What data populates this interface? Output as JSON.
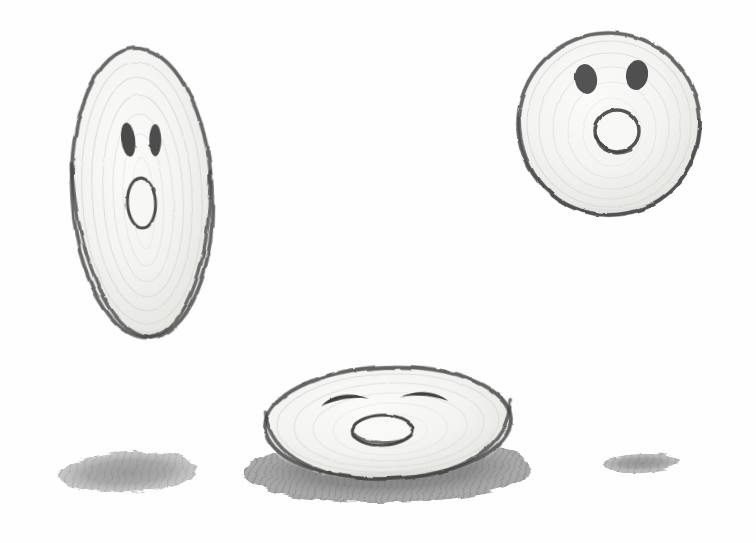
{
  "artwork": {
    "title": "Three Onion Characters",
    "medium": "graphite pencil on white paper",
    "canvas": {
      "width": 756,
      "height": 543,
      "background_color": "#fefefe"
    },
    "palette": {
      "paper": "#fefefe",
      "outline_light": "#9a9a9a",
      "outline_dark": "#5c5c5c",
      "outline_darkest": "#3e3e3e",
      "interior_fill": "#f4f4f2",
      "interior_shade": "#e3e3e1",
      "ring_texture": "#d8d8d6",
      "feature_fill": "#4a4a4a",
      "shadow_dark": "#6e6e6e",
      "shadow_mid": "#8c8c8c",
      "shadow_light": "#b4b4b4"
    }
  },
  "figures": [
    {
      "id": "figure-tall-left",
      "label": "Tall vertical onion character",
      "shape": "vertical ellipse",
      "center": {
        "x": 142,
        "y": 193
      },
      "radius": {
        "x": 70,
        "y": 145
      },
      "rotation_deg": -3,
      "expression": "surprised",
      "eyes": {
        "style": "filled vertical capsules",
        "left": {
          "cx": 131,
          "cy": 139,
          "rx": 7,
          "ry": 17
        },
        "right": {
          "cx": 158,
          "cy": 141,
          "rx": 6,
          "ry": 16
        }
      },
      "mouth": {
        "style": "open vertical oval outline",
        "cx": 141,
        "cy": 203,
        "rx": 14,
        "ry": 25,
        "filled": false
      },
      "stray_stroke": true
    },
    {
      "id": "figure-round-right",
      "label": "Round onion character, upper right",
      "shape": "circle",
      "center": {
        "x": 609,
        "y": 124
      },
      "radius": {
        "x": 91,
        "y": 91
      },
      "rotation_deg": 0,
      "expression": "surprised",
      "eyes": {
        "style": "filled tilted ovals",
        "left": {
          "cx": 586,
          "cy": 79,
          "rx": 11,
          "ry": 15
        },
        "right": {
          "cx": 637,
          "cy": 75,
          "rx": 11,
          "ry": 15
        }
      },
      "mouth": {
        "style": "open circular ring outline",
        "cx": 617,
        "cy": 131,
        "rx": 22,
        "ry": 21,
        "filled": false
      },
      "stray_stroke": false
    },
    {
      "id": "figure-squashed-bottom",
      "label": "Squashed wide onion character, bottom center",
      "shape": "wide flattened ellipse",
      "center": {
        "x": 388,
        "y": 423
      },
      "radius": {
        "x": 123,
        "y": 56
      },
      "rotation_deg": -2,
      "expression": "happy",
      "eyes": {
        "style": "arched curved lines",
        "left": {
          "cx": 346,
          "cy": 402,
          "rx": 24,
          "ry": 11
        },
        "right": {
          "cx": 425,
          "cy": 399,
          "rx": 24,
          "ry": 11
        }
      },
      "mouth": {
        "style": "wide flat oval outline",
        "cx": 382,
        "cy": 430,
        "rx": 30,
        "ry": 15,
        "filled": false
      },
      "stray_stroke": false
    }
  ],
  "shadows": [
    {
      "id": "shadow-left",
      "label": "Cast shadow ellipse, lower left",
      "cx": 128,
      "cy": 472,
      "rx": 70,
      "ry": 20,
      "rotation_deg": -3,
      "tone": "medium hatched"
    },
    {
      "id": "shadow-center",
      "label": "Cast shadow beneath squashed character",
      "cx": 388,
      "cy": 470,
      "rx": 144,
      "ry": 33,
      "rotation_deg": -1,
      "tone": "dark hatched"
    },
    {
      "id": "shadow-right",
      "label": "Small cast shadow ellipse, lower right",
      "cx": 641,
      "cy": 463,
      "rx": 38,
      "ry": 9,
      "rotation_deg": -2,
      "tone": "medium hatched"
    }
  ]
}
